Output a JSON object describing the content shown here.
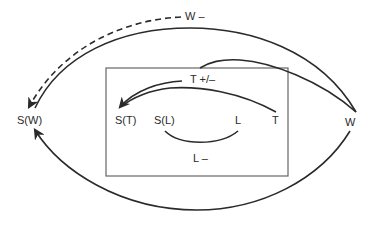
{
  "diagram": {
    "type": "state-transition-diagram",
    "colors": {
      "stroke": "#2a2a2a",
      "box": "#666666",
      "background": "#ffffff"
    },
    "nodes": {
      "sw": {
        "label": "S(W)"
      },
      "w": {
        "label": "W"
      },
      "st": {
        "label": "S(T)"
      },
      "sl": {
        "label": "S(L)"
      },
      "l": {
        "label": "L"
      },
      "t": {
        "label": "T"
      }
    },
    "edges": {
      "w_minus": {
        "label": "W –",
        "from": "W",
        "to": "S(W)",
        "style": "dashed"
      },
      "t_plus_minus": {
        "label": "T +/–",
        "from": "T",
        "to": "S(T)",
        "style": "solid"
      },
      "l_minus": {
        "label": "L –",
        "from": "S(L)",
        "to": "L",
        "style": "solid"
      },
      "w_upper": {
        "label": "",
        "from": "W",
        "to": "S(W)",
        "style": "solid"
      },
      "w_lower": {
        "label": "",
        "from": "W",
        "to": "S(W)",
        "style": "solid"
      },
      "w_to_box": {
        "label": "",
        "from": "W",
        "to": "S(T)",
        "style": "solid"
      }
    }
  }
}
